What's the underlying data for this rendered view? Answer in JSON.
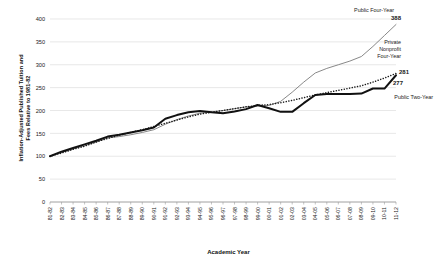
{
  "chart_data": {
    "type": "line",
    "title": "",
    "xlabel": "Academic Year",
    "ylabel": "Inflation-Adjusted Published Tuition and Fees Relative to 1981-82",
    "ylabel_line1": "Inflation-Adjusted Published Tuition and",
    "ylabel_line2": "Fees Relative to 1981-82",
    "ylim": [
      0,
      400
    ],
    "yticks": [
      0,
      50,
      100,
      150,
      200,
      250,
      300,
      350,
      400
    ],
    "grid": true,
    "legend_position": "inline-annotations",
    "categories": [
      "81-82",
      "82-83",
      "83-84",
      "84-85",
      "85-86",
      "86-87",
      "87-88",
      "88-89",
      "89-90",
      "90-91",
      "91-92",
      "92-93",
      "93-94",
      "94-95",
      "95-96",
      "96-97",
      "97-98",
      "98-99",
      "99-00",
      "00-01",
      "01-02",
      "02-03",
      "03-04",
      "04-05",
      "05-06",
      "06-07",
      "07-08",
      "08-09",
      "09-10",
      "10-11",
      "11-12"
    ],
    "series": [
      {
        "name": "Public Four-Year",
        "style": "thin-gray-line",
        "color": "#7a7a7a",
        "end_value": 388,
        "end_label": "388",
        "label_lines": [
          "Public Four-Year"
        ],
        "values": [
          100,
          108,
          116,
          123,
          131,
          140,
          143,
          147,
          152,
          158,
          170,
          180,
          188,
          194,
          197,
          200,
          204,
          208,
          210,
          211,
          220,
          240,
          262,
          282,
          292,
          300,
          308,
          318,
          340,
          364,
          388
        ]
      },
      {
        "name": "Private Nonprofit Four-Year",
        "style": "dotted-line",
        "color": "#1a1a1a",
        "end_value": 281,
        "end_label": "281",
        "label_lines": [
          "Private",
          "Nonprofit",
          "Four-Year"
        ],
        "values": [
          100,
          107,
          115,
          122,
          131,
          139,
          146,
          152,
          158,
          165,
          172,
          179,
          186,
          192,
          196,
          200,
          204,
          208,
          211,
          213,
          217,
          222,
          228,
          234,
          239,
          244,
          249,
          254,
          262,
          271,
          281
        ]
      },
      {
        "name": "Public Two-Year",
        "style": "thick-black-line",
        "color": "#111111",
        "end_value": 277,
        "end_label": "277",
        "label_lines": [
          "Public Two-Year"
        ],
        "values": [
          100,
          110,
          118,
          126,
          134,
          143,
          147,
          152,
          157,
          163,
          182,
          190,
          196,
          199,
          196,
          194,
          198,
          203,
          212,
          205,
          197,
          197,
          216,
          234,
          236,
          236,
          236,
          237,
          248,
          248,
          277
        ]
      }
    ]
  },
  "annotations": {
    "public_four_year_label": "Public Four-Year",
    "public_four_year_value": "388",
    "private_nonprofit_label_1": "Private",
    "private_nonprofit_label_2": "Nonprofit",
    "private_nonprofit_label_3": "Four-Year",
    "private_nonprofit_value": "281",
    "public_two_year_label": "Public Two-Year",
    "public_two_year_value": "277"
  },
  "axes": {
    "y_title_line1": "Inflation-Adjusted Published Tuition and",
    "y_title_line2": "Fees Relative to 1981-82",
    "x_title": "Academic Year",
    "y_tick_0": "0",
    "y_tick_50": "50",
    "y_tick_100": "100",
    "y_tick_150": "150",
    "y_tick_200": "200",
    "y_tick_250": "250",
    "y_tick_300": "300",
    "y_tick_350": "350",
    "y_tick_400": "400"
  },
  "colors": {
    "grid": "#d9d9d9",
    "axis": "#9a9a9a",
    "text": "#1a1a1a",
    "public_four_year": "#7a7a7a",
    "private_nonprofit": "#1a1a1a",
    "public_two_year": "#111111"
  }
}
